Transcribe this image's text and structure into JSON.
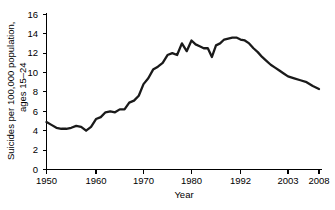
{
  "chart_data": {
    "type": "line",
    "title": "",
    "xlabel": "Year",
    "ylabel": "Suicides per 100,000 population, ages 15–24",
    "ylabel_line1": "Suicides per 100,000 population,",
    "ylabel_line2": "ages 15–24",
    "xlim": [
      1950,
      2008
    ],
    "ylim": [
      0,
      16
    ],
    "ytick_labels": [
      "0",
      "2",
      "4",
      "6",
      "8",
      "10",
      "12",
      "14",
      "16"
    ],
    "yticks": [
      0,
      2,
      4,
      6,
      8,
      10,
      12,
      14,
      16
    ],
    "xtick_labels": [
      "1950",
      "1960",
      "1970",
      "1980",
      "1992",
      "2003",
      "2008"
    ],
    "xticks": [
      1950,
      1960,
      1970,
      1980,
      1992,
      2003,
      2008
    ],
    "grid": false,
    "legend": false,
    "series": [
      {
        "name": "Suicide rate, ages 15-24",
        "color": "#1a1a1a",
        "x": [
          1950,
          1951,
          1952,
          1953,
          1954,
          1955,
          1956,
          1957,
          1958,
          1959,
          1960,
          1961,
          1962,
          1963,
          1964,
          1965,
          1966,
          1967,
          1968,
          1969,
          1970,
          1971,
          1972,
          1973,
          1974,
          1975,
          1976,
          1977,
          1978,
          1979,
          1980,
          1981,
          1982,
          1983,
          1984,
          1985,
          1986,
          1987,
          1988,
          1989,
          1990,
          1991,
          1992,
          1993,
          1994,
          1995,
          1996,
          1997,
          1998,
          1999,
          2000,
          2001,
          2002,
          2003,
          2004,
          2005,
          2006,
          2007,
          2008
        ],
        "values": [
          4.9,
          4.6,
          4.3,
          4.2,
          4.2,
          4.3,
          4.5,
          4.4,
          4.0,
          4.4,
          5.2,
          5.4,
          5.9,
          6.0,
          5.9,
          6.2,
          6.2,
          6.9,
          7.1,
          7.6,
          8.8,
          9.4,
          10.3,
          10.6,
          11.0,
          11.8,
          12.0,
          11.8,
          13.0,
          12.2,
          13.3,
          12.9,
          12.7,
          12.5,
          12.5,
          11.6,
          12.8,
          13.0,
          13.4,
          13.5,
          13.6,
          13.6,
          13.4,
          13.3,
          13.0,
          12.5,
          12.1,
          11.6,
          11.2,
          10.8,
          10.5,
          10.2,
          9.9,
          9.6,
          9.4,
          9.2,
          9.0,
          8.6,
          8.3
        ]
      }
    ],
    "annotations": []
  },
  "figure": {
    "caption": ""
  }
}
